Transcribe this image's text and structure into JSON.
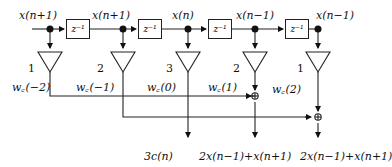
{
  "top_labels": [
    "x(n+1)",
    "x(n+1)",
    "x(n)",
    "x(n−1)",
    "x(n−1)"
  ],
  "delays": [
    "z⁻¹",
    "z⁻¹",
    "z⁻¹",
    "z⁻¹"
  ],
  "gains": [
    "1",
    "2",
    "3",
    "2",
    "1"
  ],
  "weights": [
    "w꜀(−2)",
    "w꜀(−1)",
    "w꜀(0)",
    "w꜀(1)",
    "w꜀(2)"
  ],
  "outputs": [
    "3c(n)",
    "2x(n−1)+x(n+1)",
    "2x(n−1)+x(n+1)"
  ],
  "adder_symbol": "⊕"
}
